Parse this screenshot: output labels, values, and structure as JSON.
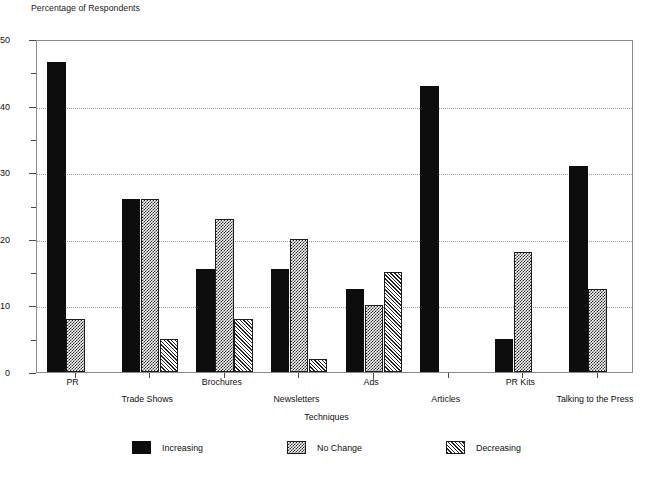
{
  "chart_data": {
    "type": "bar",
    "title": "",
    "xlabel": "Techniques",
    "ylabel": "Percentage of Respondents",
    "ylim": [
      0,
      50
    ],
    "y_ticks_major": [
      0,
      10,
      20,
      30,
      40,
      50
    ],
    "y_ticks_minor": [
      5,
      15,
      25,
      35,
      45
    ],
    "grid": "horizontal-dotted",
    "legend_position": "bottom-center",
    "categories": [
      "PR",
      "Trade Shows",
      "Brochures",
      "Newsletters",
      "Ads",
      "Articles",
      "PR Kits",
      "Talking to the Press"
    ],
    "series": [
      {
        "name": "Increasing",
        "pattern": "solid-black",
        "color": "#0d0d0d",
        "values": [
          46.5,
          26,
          15.5,
          15.5,
          12.5,
          43,
          5,
          31
        ]
      },
      {
        "name": "No Change",
        "pattern": "checkerboard",
        "color": "#2b2b2b",
        "values": [
          8,
          26,
          23,
          20,
          10,
          0,
          18,
          12.5
        ]
      },
      {
        "name": "Decreasing",
        "pattern": "diagonal-hatch",
        "color": "#242424",
        "values": [
          0,
          5,
          8,
          2,
          15,
          0,
          0,
          0
        ]
      }
    ]
  },
  "axes": {
    "y_title": "Percentage of Respondents",
    "x_title": "Techniques",
    "y_tick_labels": [
      "50",
      "40",
      "30",
      "20",
      "10",
      "0"
    ]
  },
  "legend": {
    "items": [
      {
        "label": "Increasing"
      },
      {
        "label": "No Change"
      },
      {
        "label": "Decreasing"
      }
    ]
  },
  "header": {
    "clipped_title": ""
  }
}
